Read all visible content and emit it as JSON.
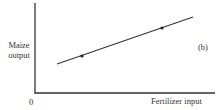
{
  "chart_data": {
    "type": "line",
    "title": "",
    "panel_label": "(b)",
    "xlabel": "Fertilizer input",
    "ylabel": "Maize output",
    "origin_label": "0",
    "grid": false,
    "legend": null,
    "axis_ticks": false,
    "series": [
      {
        "name": "Maize output vs fertilizer input",
        "style": "straight line, upward sloping",
        "x": [
          0.12,
          0.82
        ],
        "y": [
          0.32,
          0.84
        ],
        "markers": [
          {
            "x": 0.26,
            "y": 0.41
          },
          {
            "x": 0.7,
            "y": 0.72
          }
        ]
      }
    ],
    "pixel_geometry": {
      "axis_origin": [
        35,
        93
      ],
      "y_axis_top": [
        35,
        3
      ],
      "x_axis_end": [
        215,
        93
      ],
      "line_start": [
        57,
        64
      ],
      "line_end": [
        193,
        17
      ],
      "marker_points": [
        [
          82,
          56
        ],
        [
          162,
          28
        ]
      ]
    }
  },
  "labels": {
    "ylabel_line1": "Maize",
    "ylabel_line2": "output",
    "xlabel": "Fertilizer input",
    "origin": "0",
    "panel": "(b)"
  }
}
